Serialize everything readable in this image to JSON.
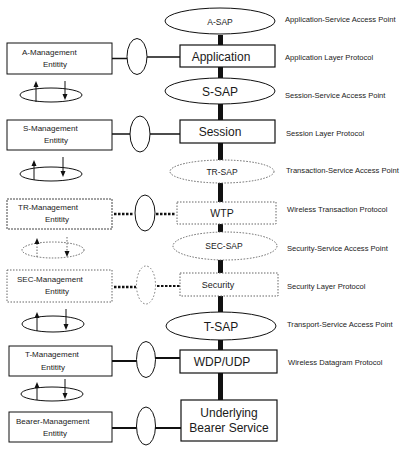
{
  "diagram": {
    "colors": {
      "line": "#111111",
      "dotted": "#555555",
      "background": "#ffffff"
    },
    "saps": [
      {
        "id": "a-sap",
        "label": "A-SAP",
        "style": "solid",
        "size": "sm"
      },
      {
        "id": "s-sap",
        "label": "S-SAP",
        "style": "solid",
        "size": "lg"
      },
      {
        "id": "tr-sap",
        "label": "TR-SAP",
        "style": "dotted",
        "size": "sm"
      },
      {
        "id": "sec-sap",
        "label": "SEC-SAP",
        "style": "dotted",
        "size": "sm"
      },
      {
        "id": "t-sap",
        "label": "T-SAP",
        "style": "solid",
        "size": "lg"
      }
    ],
    "layers": [
      {
        "id": "application",
        "label": "Application",
        "style": "solid"
      },
      {
        "id": "session",
        "label": "Session",
        "style": "solid"
      },
      {
        "id": "wtp",
        "label": "WTP",
        "style": "dotted"
      },
      {
        "id": "security",
        "label": "Security",
        "style": "dotted"
      },
      {
        "id": "wdp-udp",
        "label": "WDP/UDP",
        "style": "solid"
      },
      {
        "id": "bearer",
        "label_line1": "Underlying",
        "label_line2": "Bearer Service",
        "style": "solid"
      }
    ],
    "management_entities": [
      {
        "id": "a-mgmt",
        "line1": "A-Management",
        "line2": "Entitity",
        "style": "solid"
      },
      {
        "id": "s-mgmt",
        "line1": "S-Management",
        "line2": "Entitity",
        "style": "solid"
      },
      {
        "id": "tr-mgmt",
        "line1": "TR-Management",
        "line2": "Entitity",
        "style": "dotted"
      },
      {
        "id": "sec-mgmt",
        "line1": "SEC-Management",
        "line2": "Entitity",
        "style": "dotted"
      },
      {
        "id": "t-mgmt",
        "line1": "T-Management",
        "line2": "Entitity",
        "style": "solid"
      },
      {
        "id": "bearer-mgmt",
        "line1": "Bearer-Management",
        "line2": "Entitity",
        "style": "solid"
      }
    ],
    "right_labels": [
      "Application-Service Access Point",
      "Application Layer Protocol",
      "Session-Service Access Point",
      "Session Layer Protocol",
      "Transaction-Service Access Point",
      "Wireless Transaction Protocol",
      "Security-Service Access Point",
      "Security Layer Protocol",
      "Transport-Service Access Point",
      "Wireless Datagram Protocol"
    ]
  }
}
